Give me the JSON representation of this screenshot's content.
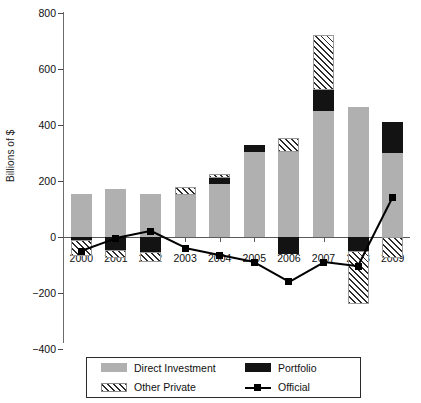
{
  "chart_data": {
    "type": "bar",
    "title": "",
    "subtitle": "",
    "xlabel": "",
    "ylabel": "Billions of $",
    "ylim": [
      -400,
      800
    ],
    "ytick_values": [
      800,
      600,
      400,
      200,
      0,
      -200,
      -400
    ],
    "ytick_labels": [
      "800",
      "600",
      "400",
      "200",
      "0",
      "−200",
      "−400"
    ],
    "grid": false,
    "stacked": true,
    "legend_position": "bottom",
    "categories": [
      "2000",
      "2001",
      "2002",
      "2003",
      "2004",
      "2005",
      "2006",
      "2007",
      "2008",
      "2009"
    ],
    "series": [
      {
        "name": "Direct Investment",
        "kind": "bar",
        "color": "#b0b0b0",
        "pattern": "solid-gray",
        "values": [
          155,
          170,
          155,
          150,
          190,
          305,
          305,
          450,
          465,
          300
        ]
      },
      {
        "name": "Portfolio",
        "kind": "bar",
        "color": "#131313",
        "pattern": "solid-black",
        "values": [
          -12,
          -48,
          -55,
          0,
          20,
          25,
          -60,
          75,
          -50,
          110
        ]
      },
      {
        "name": "Other Private",
        "kind": "bar",
        "color": "#ffffff",
        "pattern": "diagonal-hatch",
        "values": [
          -55,
          -28,
          -35,
          28,
          15,
          0,
          50,
          195,
          -190,
          -75
        ]
      },
      {
        "name": "Official",
        "kind": "line",
        "color": "#000000",
        "marker": "square",
        "values": [
          -50,
          -5,
          20,
          -40,
          -65,
          -90,
          -160,
          -90,
          -105,
          140
        ]
      }
    ]
  },
  "legend": {
    "entries": [
      {
        "label": "Direct Investment",
        "swatch": "solid-gray"
      },
      {
        "label": "Portfolio",
        "swatch": "solid-black"
      },
      {
        "label": "Other Private",
        "swatch": "diagonal-hatch"
      },
      {
        "label": "Official",
        "swatch": "line-square-marker"
      }
    ]
  },
  "colors": {
    "direct_investment": "#b0b0b0",
    "portfolio": "#131313",
    "other_private": "#ffffff",
    "official": "#000000",
    "axis": "#5a5a5a"
  }
}
